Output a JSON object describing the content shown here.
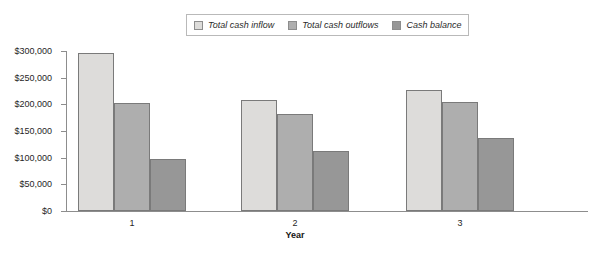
{
  "chart_data": {
    "type": "bar",
    "title": "",
    "xlabel": "Year",
    "ylabel": "",
    "categories": [
      "1",
      "2",
      "3"
    ],
    "ylim": [
      0,
      300000
    ],
    "ytick_values": [
      0,
      50000,
      100000,
      150000,
      200000,
      250000,
      300000
    ],
    "ytick_labels": [
      "$0",
      "$50,000",
      "$100,000",
      "$150,000",
      "$200,000",
      "$250,000",
      "$300,000"
    ],
    "grid": false,
    "legend_position": "top-center",
    "series": [
      {
        "name": "Total cash inflow",
        "color": "#dddcda",
        "values": [
          297000,
          208000,
          226000
        ]
      },
      {
        "name": "Total cash outflows",
        "color": "#aeaeae",
        "values": [
          202000,
          182000,
          204000
        ]
      },
      {
        "name": "Cash balance",
        "color": "#979797",
        "values": [
          98000,
          112000,
          136000
        ]
      }
    ]
  }
}
